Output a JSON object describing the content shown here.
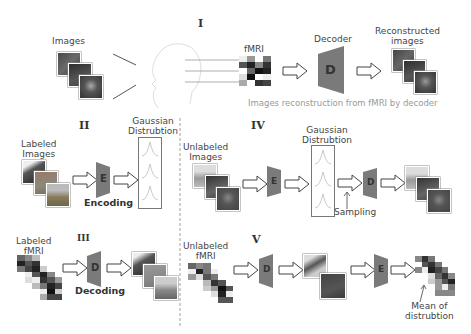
{
  "sections": {
    "I": {
      "numeral": "I",
      "images_label": "Images",
      "fmri_label": "fMRI",
      "decoder_label": "Decoder",
      "decoder_letter": "D",
      "reconstructed_label_line1": "Reconstructed",
      "reconstructed_label_line2": "images",
      "caption": "Images reconstruction from fMRI by decoder"
    },
    "II": {
      "numeral": "II",
      "labeled_images_line1": "Labeled",
      "labeled_images_line2": "Images",
      "encoder_letter": "E",
      "encoding_label": "Encoding",
      "gaussian_line1": "Gaussian",
      "gaussian_line2": "Distrubtion"
    },
    "III": {
      "numeral": "III",
      "labeled_fmri_line1": "Labeled",
      "labeled_fmri_line2": "fMRI",
      "decoder_letter": "D",
      "decoding_label": "Decoding"
    },
    "IV": {
      "numeral": "IV",
      "unlabeled_images_line1": "Unlabeled",
      "unlabeled_images_line2": "Images",
      "encoder_letter": "E",
      "gaussian_line1": "Gaussian",
      "gaussian_line2": "Distrubtion",
      "sampling_label": "Sampling",
      "decoder_letter": "D"
    },
    "V": {
      "numeral": "V",
      "unlabeled_fmri_line1": "Unlabeled",
      "unlabeled_fmri_line2": "fMRI",
      "decoder_letter": "D",
      "encoder_letter": "E",
      "mean_label_line1": "Mean of",
      "mean_label_line2": "distrubtion"
    }
  },
  "colors": {
    "trapezoid": "#7a7a7a",
    "text": "#333333",
    "caption": "#999999",
    "gaussian_curve": "#bbbbbb",
    "dashed_divider": "#888888"
  }
}
